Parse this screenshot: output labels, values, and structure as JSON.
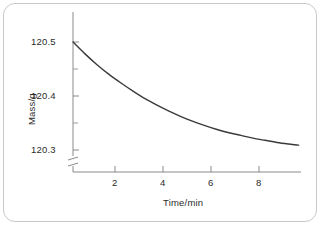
{
  "chart_data": {
    "type": "line",
    "title": "",
    "subtitle": "",
    "xlabel": "Time/min",
    "ylabel": "Mass/g",
    "xlim": [
      0,
      9.5
    ],
    "ylim": [
      120.28,
      120.53
    ],
    "grid": false,
    "legend": null,
    "axis_break": {
      "axis": "y",
      "present": true,
      "note": "y-axis broken below 120.3"
    },
    "xticks": [
      2,
      4,
      6,
      8
    ],
    "xtick_labels": [
      "2",
      "4",
      "6",
      "8"
    ],
    "yticks": [
      120.3,
      120.4,
      120.5
    ],
    "ytick_labels": [
      "120.3",
      "120.4",
      "120.5"
    ],
    "y_minor_ticks": [
      120.35,
      120.45
    ],
    "series": [
      {
        "name": "mass",
        "x": [
          0,
          0.5,
          1,
          1.5,
          2,
          2.5,
          3,
          3.5,
          4,
          4.5,
          5,
          5.5,
          6,
          6.5,
          7,
          7.5,
          8,
          8.5,
          9,
          9.4
        ],
        "y": [
          120.5,
          120.478,
          120.458,
          120.44,
          120.424,
          120.409,
          120.395,
          120.383,
          120.372,
          120.362,
          120.353,
          120.345,
          120.338,
          120.332,
          120.327,
          120.322,
          120.318,
          120.314,
          120.311,
          120.309
        ]
      }
    ],
    "colors": {
      "curve": "#3a3a3a",
      "axis": "#8a8a8a",
      "text": "#2b2b2b",
      "frame": "#c8c8c8",
      "background": "#ffffff"
    }
  },
  "labels": {
    "y_tick_0": "120.3",
    "y_tick_1": "120.4",
    "y_tick_2": "120.5",
    "x_tick_0": "2",
    "x_tick_1": "4",
    "x_tick_2": "6",
    "x_tick_3": "8",
    "y_axis_title": "Mass/g",
    "x_axis_title": "Time/min"
  }
}
